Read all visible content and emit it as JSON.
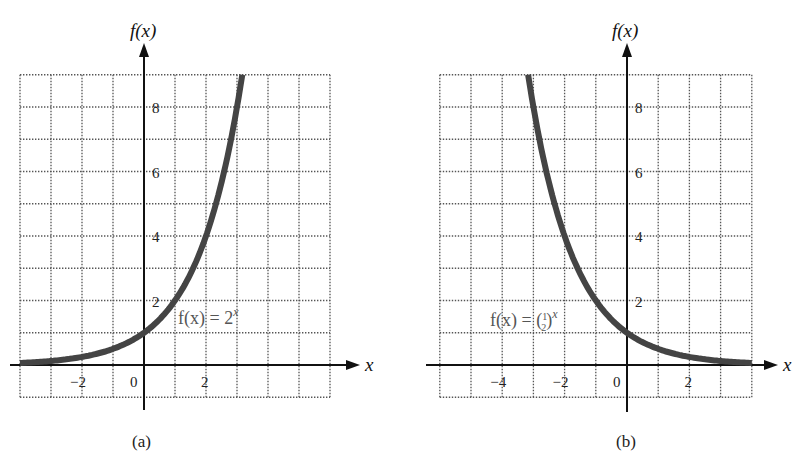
{
  "chart_data": [
    {
      "type": "line",
      "panel": "a",
      "caption": "(a)",
      "function": "f(x) = 2^x",
      "label_parts": {
        "lhs": "f(x) = 2",
        "exp": "x"
      },
      "xlabel": "x",
      "ylabel": "f(x)",
      "xlim": [
        -4,
        6
      ],
      "ylim": [
        -1,
        9
      ],
      "grid": true,
      "grid_step": 1,
      "x_ticks": [
        -2,
        0,
        2
      ],
      "x_tick_labels": [
        "−2",
        "0",
        "2"
      ],
      "y_ticks": [
        2,
        4,
        6,
        8
      ],
      "y_tick_labels": [
        "2",
        "4",
        "6",
        "8"
      ],
      "series": [
        {
          "name": "f(x) = 2^x",
          "x": [
            -4,
            -3,
            -2,
            -1,
            0,
            1,
            2,
            3,
            3.17
          ],
          "y": [
            0.0625,
            0.125,
            0.25,
            0.5,
            1,
            2,
            4,
            8,
            9
          ]
        }
      ]
    },
    {
      "type": "line",
      "panel": "b",
      "caption": "(b)",
      "function": "f(x) = (1/2)^x",
      "label_parts": {
        "lhs": "f(x) = (",
        "num": "1",
        "den": "2",
        "rhs": ")",
        "exp": "x"
      },
      "xlabel": "x",
      "ylabel": "f(x)",
      "xlim": [
        -6,
        4
      ],
      "ylim": [
        -1,
        9
      ],
      "grid": true,
      "grid_step": 1,
      "x_ticks": [
        -4,
        -2,
        0,
        2
      ],
      "x_tick_labels": [
        "−4",
        "−2",
        "0",
        "2"
      ],
      "y_ticks": [
        2,
        4,
        6,
        8
      ],
      "y_tick_labels": [
        "2",
        "4",
        "6",
        "8"
      ],
      "series": [
        {
          "name": "f(x) = (1/2)^x",
          "x": [
            -3.17,
            -3,
            -2,
            -1,
            0,
            1,
            2,
            3,
            4
          ],
          "y": [
            9,
            8,
            4,
            2,
            1,
            0.5,
            0.25,
            0.125,
            0.0625
          ]
        }
      ]
    }
  ]
}
